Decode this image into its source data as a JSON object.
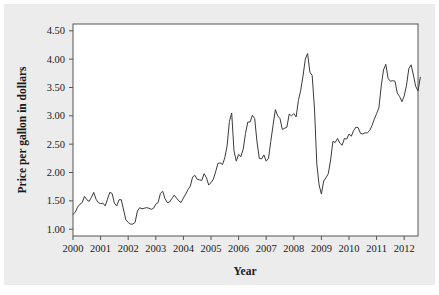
{
  "chart_data": {
    "type": "line",
    "title": "",
    "subtitle": "",
    "xlabel": "Year",
    "ylabel": "Price per gallon in dollars",
    "xlim": [
      2000.0,
      2012.5
    ],
    "ylim": [
      0.88,
      4.62
    ],
    "x_ticks": [
      2000,
      2001,
      2002,
      2003,
      2004,
      2005,
      2006,
      2007,
      2008,
      2009,
      2010,
      2011,
      2012
    ],
    "x_tick_labels": [
      "2000",
      "2001",
      "2002",
      "2003",
      "2004",
      "2005",
      "2006",
      "2007",
      "2008",
      "2009",
      "2010",
      "2011",
      "2012"
    ],
    "y_ticks": [
      1.0,
      1.5,
      2.0,
      2.5,
      3.0,
      3.5,
      4.0,
      4.5
    ],
    "y_tick_labels": [
      "1.00",
      "1.50",
      "2.00",
      "2.50",
      "3.00",
      "3.50",
      "4.00",
      "4.50"
    ],
    "grid": false,
    "legend": false,
    "legend_position": "none",
    "line_color": "#3a3a3a",
    "frame_color": "#555555",
    "plot_background": "#ffffff",
    "figure_background": "#ececec",
    "series": [
      {
        "name": "Price per gallon in dollars",
        "x_start": 2000.0,
        "x_step": 0.0833333,
        "values": [
          1.26,
          1.3,
          1.39,
          1.44,
          1.47,
          1.58,
          1.52,
          1.49,
          1.56,
          1.65,
          1.53,
          1.47,
          1.45,
          1.46,
          1.41,
          1.53,
          1.65,
          1.63,
          1.46,
          1.41,
          1.52,
          1.52,
          1.34,
          1.16,
          1.12,
          1.09,
          1.09,
          1.12,
          1.32,
          1.38,
          1.36,
          1.37,
          1.38,
          1.37,
          1.35,
          1.37,
          1.44,
          1.47,
          1.63,
          1.67,
          1.54,
          1.47,
          1.48,
          1.54,
          1.6,
          1.55,
          1.5,
          1.47,
          1.55,
          1.62,
          1.7,
          1.76,
          1.92,
          1.95,
          1.88,
          1.87,
          1.86,
          1.98,
          1.91,
          1.78,
          1.82,
          1.88,
          2.01,
          2.16,
          2.17,
          2.14,
          2.26,
          2.47,
          2.9,
          3.05,
          2.38,
          2.2,
          2.32,
          2.28,
          2.41,
          2.69,
          2.89,
          2.89,
          3.01,
          2.95,
          2.54,
          2.25,
          2.24,
          2.31,
          2.2,
          2.25,
          2.55,
          2.84,
          3.11,
          3.0,
          2.95,
          2.76,
          2.78,
          2.8,
          3.03,
          3.0,
          3.04,
          2.98,
          3.27,
          3.45,
          3.7,
          4.0,
          4.1,
          3.77,
          3.71,
          3.12,
          2.15,
          1.78,
          1.62,
          1.85,
          1.91,
          1.98,
          2.22,
          2.55,
          2.53,
          2.6,
          2.52,
          2.48,
          2.6,
          2.59,
          2.68,
          2.64,
          2.74,
          2.8,
          2.79,
          2.69,
          2.68,
          2.7,
          2.7,
          2.74,
          2.83,
          2.94,
          3.04,
          3.14,
          3.52,
          3.81,
          3.91,
          3.66,
          3.61,
          3.62,
          3.61,
          3.4,
          3.34,
          3.25,
          3.35,
          3.54,
          3.83,
          3.9,
          3.72,
          3.52,
          3.44,
          3.68
        ]
      }
    ],
    "annotations": [],
    "notable_points": [
      {
        "label": "2002 trough",
        "x": 2002.1,
        "y": 1.07
      },
      {
        "label": "2005 hurricane spike",
        "x": 2005.7,
        "y": 3.05
      },
      {
        "label": "2008 peak",
        "x": 2008.5,
        "y": 4.1
      },
      {
        "label": "2009 crash trough",
        "x": 2009.0,
        "y": 1.62
      },
      {
        "label": "2011 peak",
        "x": 2011.35,
        "y": 3.91
      },
      {
        "label": "2012 peak",
        "x": 2012.25,
        "y": 3.9
      }
    ]
  }
}
